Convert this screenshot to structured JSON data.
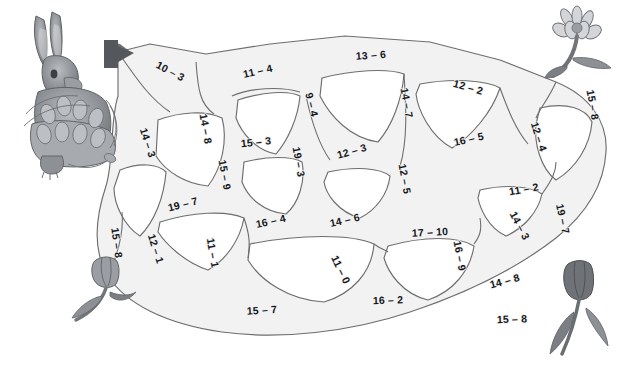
{
  "worksheet": {
    "type": "subtraction-maze",
    "title": "Subtraction Maze",
    "entrance_marker": "arrow-right",
    "decorations": [
      {
        "name": "rabbit-with-tulip-basket",
        "position": "top-left"
      },
      {
        "name": "flower-bloom",
        "position": "top-right"
      },
      {
        "name": "tulip-flower",
        "position": "bottom-left"
      },
      {
        "name": "tulip-flower",
        "position": "bottom-right"
      }
    ]
  },
  "maze": {
    "labels": [
      {
        "id": "l01",
        "text": "10 – 3",
        "x": 170,
        "y": 72,
        "rot": 28
      },
      {
        "id": "l02",
        "text": "11 – 4",
        "x": 258,
        "y": 72,
        "rot": -13
      },
      {
        "id": "l03",
        "text": "13 – 6",
        "x": 371,
        "y": 56,
        "rot": -4
      },
      {
        "id": "l04",
        "text": "12 – 2",
        "x": 468,
        "y": 88,
        "rot": 16
      },
      {
        "id": "l05",
        "text": "15 – 8",
        "x": 592,
        "y": 105,
        "rot": 80
      },
      {
        "id": "l06",
        "text": "14 – 3",
        "x": 147,
        "y": 143,
        "rot": 72
      },
      {
        "id": "l07",
        "text": "14 – 8",
        "x": 205,
        "y": 129,
        "rot": 80
      },
      {
        "id": "l08",
        "text": "15 – 3",
        "x": 256,
        "y": 143,
        "rot": -6
      },
      {
        "id": "l09",
        "text": "9 – 4",
        "x": 311,
        "y": 105,
        "rot": 76
      },
      {
        "id": "l10",
        "text": "14 – 7",
        "x": 406,
        "y": 103,
        "rot": 80
      },
      {
        "id": "l11",
        "text": "16 – 5",
        "x": 469,
        "y": 140,
        "rot": -12
      },
      {
        "id": "l12",
        "text": "12 – 4",
        "x": 538,
        "y": 137,
        "rot": 72
      },
      {
        "id": "l13",
        "text": "15 – 9",
        "x": 224,
        "y": 175,
        "rot": 80
      },
      {
        "id": "l14",
        "text": "19 – 3",
        "x": 298,
        "y": 162,
        "rot": 80
      },
      {
        "id": "l15",
        "text": "12 – 3",
        "x": 352,
        "y": 152,
        "rot": -16
      },
      {
        "id": "l16",
        "text": "12 – 5",
        "x": 404,
        "y": 179,
        "rot": 80
      },
      {
        "id": "l17",
        "text": "11 – 2",
        "x": 524,
        "y": 190,
        "rot": -10
      },
      {
        "id": "l18",
        "text": "19 – 7",
        "x": 183,
        "y": 205,
        "rot": -14
      },
      {
        "id": "l19",
        "text": "16 – 4",
        "x": 271,
        "y": 222,
        "rot": -12
      },
      {
        "id": "l20",
        "text": "14 – 6",
        "x": 345,
        "y": 221,
        "rot": -12
      },
      {
        "id": "l21",
        "text": "17 – 10",
        "x": 430,
        "y": 233,
        "rot": -3
      },
      {
        "id": "l22",
        "text": "19 – 7",
        "x": 562,
        "y": 219,
        "rot": 78
      },
      {
        "id": "l23",
        "text": "14 – 3",
        "x": 519,
        "y": 226,
        "rot": 62
      },
      {
        "id": "l24",
        "text": "15 – 8",
        "x": 116,
        "y": 243,
        "rot": 82
      },
      {
        "id": "l25",
        "text": "12 – 1",
        "x": 155,
        "y": 249,
        "rot": 72
      },
      {
        "id": "l26",
        "text": "11 – 1",
        "x": 212,
        "y": 253,
        "rot": 80
      },
      {
        "id": "l27",
        "text": "11 – 0",
        "x": 340,
        "y": 270,
        "rot": 64
      },
      {
        "id": "l28",
        "text": "16 – 9",
        "x": 459,
        "y": 256,
        "rot": 80
      },
      {
        "id": "l29",
        "text": "14 – 8",
        "x": 505,
        "y": 282,
        "rot": -15
      },
      {
        "id": "l30",
        "text": "15 – 7",
        "x": 262,
        "y": 311,
        "rot": -4
      },
      {
        "id": "l31",
        "text": "16 – 2",
        "x": 388,
        "y": 301,
        "rot": -2
      },
      {
        "id": "l32",
        "text": "15 – 8",
        "x": 512,
        "y": 320,
        "rot": -2
      }
    ]
  },
  "colors": {
    "path_fill": "#f2f2f2",
    "path_stroke": "#6e6e6e",
    "label_text": "#14161a",
    "arrow": "#55585c",
    "background": "#ffffff",
    "artwork_gray": "#7b7e83"
  }
}
